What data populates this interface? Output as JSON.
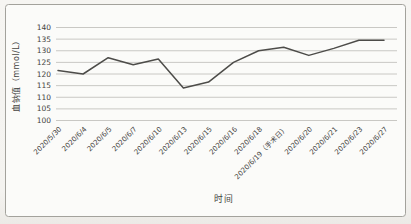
{
  "chart_data": {
    "type": "line",
    "title": "",
    "xlabel": "时间",
    "ylabel": "血钠值（mmol/L）",
    "categories": [
      "2020/5/30",
      "2020/6/4",
      "2020/6/5",
      "2020/6/7",
      "2020/6/10",
      "2020/6/13",
      "2020/6/15",
      "2020/6/16",
      "2020/6/18",
      "2020/6/19（手术日）",
      "2020/6/20",
      "2020/6/21",
      "2020/6/23",
      "2020/6/27"
    ],
    "series": [
      {
        "name": "血钠值",
        "values": [
          121.5,
          120,
          127,
          124,
          126.5,
          114,
          116.5,
          125,
          130,
          131.5,
          128,
          131,
          134.5,
          134.5
        ]
      }
    ],
    "ylim": [
      100,
      140
    ],
    "ytick_step": 5,
    "yticks": [
      140,
      135,
      130,
      125,
      120,
      115,
      110,
      105,
      100
    ],
    "grid": "horizontal",
    "legend": "none",
    "colors": {
      "line": "#4d4c49",
      "grid": "#c9c8c4",
      "text": "#44433f",
      "frame": "#a3a29c",
      "background": "#f4f3f0",
      "plot_background": "#fbfbf9"
    }
  }
}
